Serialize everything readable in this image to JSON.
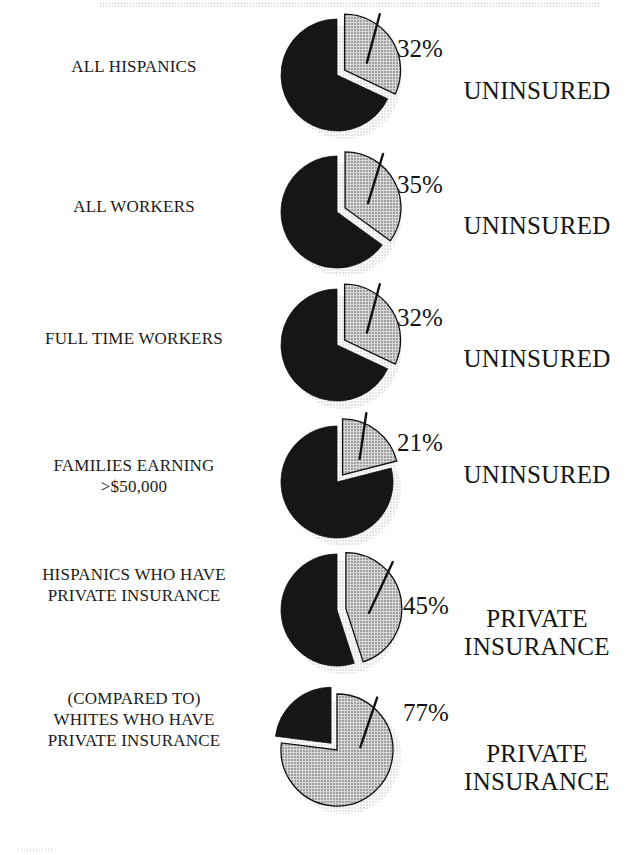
{
  "figure": {
    "kind": "pie-chart-series",
    "colors": {
      "dark_slice": "#161616",
      "dotted_slice_fill": "#d8d8d8",
      "dotted_slice_dot": "#4a4a4a",
      "outline": "#111111",
      "shadow": "#bdbdbd",
      "text": "#151515",
      "background": "#ffffff"
    },
    "leader_line_label": "callout-leader-line"
  },
  "chart_data": {
    "type": "pie",
    "title": "",
    "subtitle": "",
    "xlabel": "",
    "ylabel": "",
    "legend_position": "inline-right",
    "grid": false,
    "note": "Six separate pie charts. Each highlights one exploded slice whose share is labelled with a percentage callout; the right-hand caption names what the highlighted slice represents.",
    "charts": [
      {
        "id": "all-hispanics",
        "left_label_lines": [
          "ALL HISPANICS"
        ],
        "highlight_percent": 32,
        "percent_text": "32%",
        "remainder_percent": 68,
        "right_label_lines": [
          "UNINSURED"
        ],
        "exploded_slice": "highlight",
        "highlight_style": "dotted",
        "remainder_style": "solid-black"
      },
      {
        "id": "all-workers",
        "left_label_lines": [
          "ALL WORKERS"
        ],
        "highlight_percent": 35,
        "percent_text": "35%",
        "remainder_percent": 65,
        "right_label_lines": [
          "UNINSURED"
        ],
        "exploded_slice": "highlight",
        "highlight_style": "dotted",
        "remainder_style": "solid-black"
      },
      {
        "id": "full-time-workers",
        "left_label_lines": [
          "FULL TIME WORKERS"
        ],
        "highlight_percent": 32,
        "percent_text": "32%",
        "remainder_percent": 68,
        "right_label_lines": [
          "UNINSURED"
        ],
        "exploded_slice": "highlight",
        "highlight_style": "dotted",
        "remainder_style": "solid-black"
      },
      {
        "id": "families-earning-over-50000",
        "left_label_lines": [
          "FAMILIES EARNING",
          ">$50,000"
        ],
        "highlight_percent": 21,
        "percent_text": "21%",
        "remainder_percent": 79,
        "right_label_lines": [
          "UNINSURED"
        ],
        "exploded_slice": "highlight",
        "highlight_style": "dotted",
        "remainder_style": "solid-black"
      },
      {
        "id": "hispanics-private-insurance",
        "left_label_lines": [
          "HISPANICS WHO HAVE",
          "PRIVATE INSURANCE"
        ],
        "highlight_percent": 45,
        "percent_text": "45%",
        "remainder_percent": 55,
        "right_label_lines": [
          "PRIVATE",
          "INSURANCE"
        ],
        "exploded_slice": "highlight",
        "highlight_style": "dotted",
        "remainder_style": "solid-black"
      },
      {
        "id": "whites-private-insurance",
        "left_label_lines": [
          "(COMPARED TO)",
          "WHITES WHO HAVE",
          "PRIVATE INSURANCE"
        ],
        "highlight_percent": 77,
        "percent_text": "77%",
        "remainder_percent": 23,
        "right_label_lines": [
          "PRIVATE",
          "INSURANCE"
        ],
        "exploded_slice": "remainder",
        "highlight_style": "dotted",
        "remainder_style": "solid-black"
      }
    ]
  }
}
